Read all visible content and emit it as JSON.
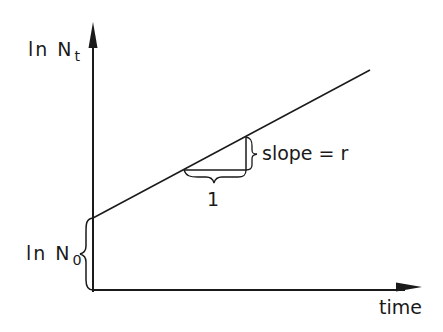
{
  "diagram": {
    "type": "exponential-growth-log-plot",
    "y_axis": {
      "label_main": "ln N",
      "label_sub": "t"
    },
    "x_axis": {
      "label": "time"
    },
    "intercept": {
      "label_main": "ln N",
      "label_sub": "0"
    },
    "slope_triangle": {
      "run_label": "1",
      "rise_label": "slope = r"
    },
    "colors": {
      "ink": "#1a1a1a",
      "background": "#ffffff"
    }
  }
}
